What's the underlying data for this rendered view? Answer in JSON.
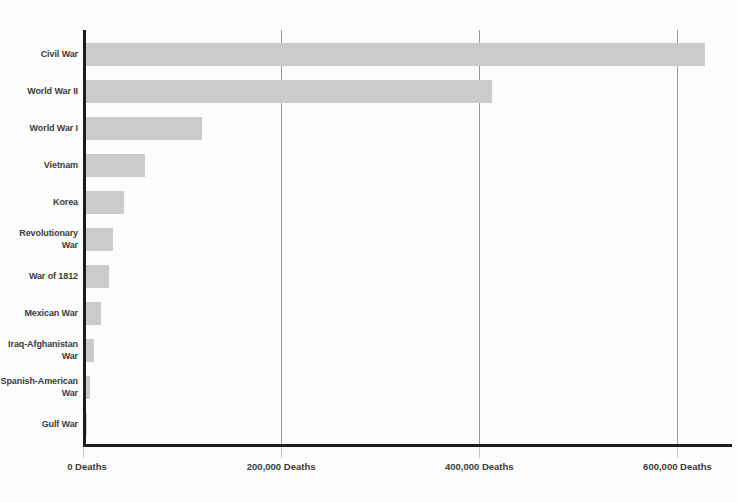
{
  "chart_data": {
    "type": "bar",
    "orientation": "horizontal",
    "title": "",
    "xlabel": "",
    "ylabel": "",
    "unit": "Deaths",
    "categories": [
      "Civil War",
      "World War II",
      "World War I",
      "Vietnam",
      "Korea",
      "Revolutionary\nWar",
      "War of 1812",
      "Mexican War",
      "Iraq-Afghanistan\nWar",
      "Spanish-American\nWar",
      "Gulf War"
    ],
    "values": [
      625000,
      410000,
      117000,
      60000,
      38000,
      27000,
      23000,
      15000,
      8500,
      4500,
      300
    ],
    "x_ticks": [
      {
        "value": 0,
        "label": "0 Deaths"
      },
      {
        "value": 200000,
        "label": "200,000 Deaths"
      },
      {
        "value": 400000,
        "label": "400,000 Deaths"
      },
      {
        "value": 600000,
        "label": "600,000 Deaths"
      }
    ],
    "xlim": [
      0,
      650000
    ],
    "grid": "vertical-lines-at-ticks",
    "legend": "none",
    "colors": {
      "bar": "#cbcbcb",
      "axis": "#1c1c1c",
      "gridline": "#999999",
      "tick_mark": "#c6c6c6",
      "text": "#3b3b3b",
      "background": "#fcfcfc"
    }
  }
}
